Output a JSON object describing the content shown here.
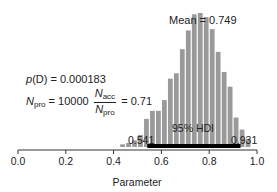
{
  "chart_data": {
    "type": "bar",
    "title": "",
    "xlabel": "Parameter",
    "ylabel": "",
    "xlim": [
      0.0,
      1.0
    ],
    "xticks": [
      0.0,
      0.2,
      0.4,
      0.6,
      0.8,
      1.0
    ],
    "xtick_labels": [
      "0.0",
      "0.2",
      "0.4",
      "0.6",
      "0.8",
      "1.0"
    ],
    "yaxis_shown": false,
    "grid": false,
    "bin_width": 0.025,
    "bins": [
      0.4375,
      0.4625,
      0.4875,
      0.5125,
      0.5375,
      0.5625,
      0.5875,
      0.6125,
      0.6375,
      0.6625,
      0.6875,
      0.7125,
      0.7375,
      0.7625,
      0.7875,
      0.8125,
      0.8375,
      0.8625,
      0.8875,
      0.9125,
      0.9375,
      0.9625
    ],
    "values": [
      2,
      3,
      5,
      9,
      21,
      27,
      27,
      35,
      51,
      55,
      73,
      87,
      99,
      100,
      97,
      88,
      71,
      56,
      45,
      22,
      13,
      6
    ],
    "value_units": "relative frequency (max = 100)",
    "color": "#9a9a9a",
    "annotations": {
      "mean_label": "Mean",
      "mean_value": "0.749",
      "hdi_label": "95% HDI",
      "hdi_low": "0.541",
      "hdi_high": "0.931",
      "pD_text": "p(D) = 0.000183",
      "npro_text": "N_pro = 10000",
      "ratio_text": "N_acc / N_pro = 0.71"
    }
  },
  "annotations": {
    "pD": {
      "prefix": "p",
      "arg": "(D)",
      "eq": " = 0.000183"
    },
    "npro": {
      "N": "N",
      "sub_pro": "pro",
      "eq_value": " = 10000",
      "frac_num_N": "N",
      "frac_num_sub": "acc",
      "frac_den_N": "N",
      "frac_den_sub": "pro",
      "result": " = 0.71"
    },
    "mean": "Mean = 0.749",
    "hdi": "95% HDI",
    "hdi_low": "0.541",
    "hdi_high": "0.931"
  },
  "axis": {
    "ticks": [
      "0.0",
      "0.2",
      "0.4",
      "0.6",
      "0.8",
      "1.0"
    ],
    "label": "Parameter"
  }
}
